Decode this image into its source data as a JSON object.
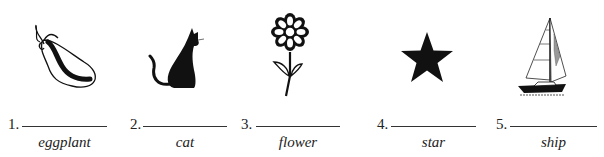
{
  "worksheet": {
    "items": [
      {
        "number": "1.",
        "label": "eggplant",
        "icon": "eggplant-icon"
      },
      {
        "number": "2.",
        "label": "cat",
        "icon": "cat-icon"
      },
      {
        "number": "3.",
        "label": "flower",
        "icon": "flower-icon"
      },
      {
        "number": "4.",
        "label": "star",
        "icon": "star-icon"
      },
      {
        "number": "5.",
        "label": "ship",
        "icon": "sailboat-icon"
      }
    ]
  }
}
